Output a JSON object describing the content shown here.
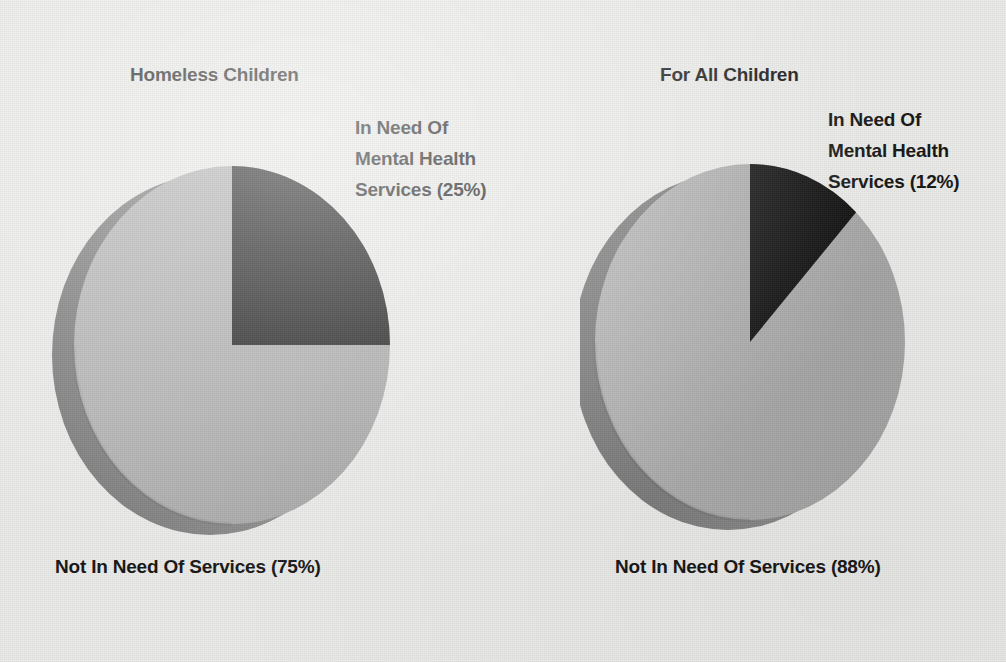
{
  "figure": {
    "background_color": "#e9e9e7",
    "text_color": "#131313"
  },
  "palette": {
    "in_need_color": "#0d0d0d",
    "not_in_need_color": "#a9a9a9",
    "side_shadow_color": "#7a7a7a",
    "rim_shadow_color": "#949494"
  },
  "charts": {
    "left": {
      "title": "Homeless Children",
      "callout_line1": "In Need Of",
      "callout_line2": "Mental Health",
      "callout_line3": "Services (25%)",
      "bottom_label": "Not In Need Of Services (75%)"
    },
    "right": {
      "title": "For All Children",
      "callout_line1": "In Need Of",
      "callout_line2": "Mental Health",
      "callout_line3": "Services (12%)",
      "bottom_label": "Not In Need Of Services (88%)"
    }
  },
  "chart_data": [
    {
      "type": "pie",
      "title": "Homeless Children",
      "labels": [
        "In Need Of Mental Health Services",
        "Not In Need Of Services"
      ],
      "values": [
        25,
        75
      ],
      "value_unit": "percent",
      "data_labels": [
        "In Need Of Mental Health Services (25%)",
        "Not In Need Of Services (75%)"
      ],
      "colors": [
        "#0d0d0d",
        "#a9a9a9"
      ],
      "start_angle_deg": 0,
      "direction": "clockwise",
      "three_d": true,
      "legend": "none",
      "grid": false
    },
    {
      "type": "pie",
      "title": "For All Children",
      "labels": [
        "In Need Of Mental Health Services",
        "Not In Need Of Services"
      ],
      "values": [
        12,
        88
      ],
      "value_unit": "percent",
      "data_labels": [
        "In Need Of Mental Health Services (12%)",
        "Not In Need Of Services (88%)"
      ],
      "colors": [
        "#0d0d0d",
        "#a9a9a9"
      ],
      "start_angle_deg": 0,
      "direction": "clockwise",
      "three_d": true,
      "legend": "none",
      "grid": false
    }
  ]
}
